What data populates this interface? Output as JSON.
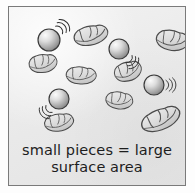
{
  "figure": {
    "background_color": "#ececec",
    "frame_color": "#7a7a7a",
    "page_color": "#ffffff"
  },
  "caption": {
    "line1": "small pieces = large",
    "line2": "surface area",
    "text_color": "#1d1d1d"
  },
  "legend": {
    "sphere_label": "reactant particle",
    "chunk_label": "solid piece",
    "motion_label": "motion lines"
  },
  "diagram_data": {
    "type": "diagram",
    "sphere_color_light": "#f2f2f2",
    "sphere_color_dark": "#8e8e8e",
    "sphere_outline": "#3a3a3a",
    "chunk_fill": "#dcdcdc",
    "chunk_outline": "#4a4a4a",
    "motion_line_color": "#2e2e2e",
    "sphere_count": 4,
    "chunk_count": 9,
    "spheres": [
      {
        "id": "sphere-1",
        "cx": 40,
        "cy": 33,
        "r": 11,
        "motion": "upper-right"
      },
      {
        "id": "sphere-2",
        "cx": 110,
        "cy": 42,
        "r": 10,
        "motion": "lower-right"
      },
      {
        "id": "sphere-3",
        "cx": 50,
        "cy": 92,
        "r": 10,
        "motion": "lower-left"
      },
      {
        "id": "sphere-4",
        "cx": 145,
        "cy": 78,
        "r": 10,
        "motion": "right"
      }
    ],
    "chunks": [
      {
        "id": "chunk-1",
        "cx": 82,
        "cy": 29,
        "w": 32,
        "h": 19,
        "rot": -12
      },
      {
        "id": "chunk-2",
        "cx": 163,
        "cy": 34,
        "w": 30,
        "h": 20,
        "rot": 10
      },
      {
        "id": "chunk-3",
        "cx": 34,
        "cy": 57,
        "w": 25,
        "h": 18,
        "rot": -6
      },
      {
        "id": "chunk-4",
        "cx": 72,
        "cy": 69,
        "w": 27,
        "h": 17,
        "rot": 4
      },
      {
        "id": "chunk-5",
        "cx": 119,
        "cy": 65,
        "w": 25,
        "h": 19,
        "rot": -15
      },
      {
        "id": "chunk-6",
        "cx": 110,
        "cy": 94,
        "w": 24,
        "h": 17,
        "rot": 8
      },
      {
        "id": "chunk-7",
        "cx": 50,
        "cy": 116,
        "w": 26,
        "h": 17,
        "rot": -8
      },
      {
        "id": "chunk-8",
        "cx": 152,
        "cy": 113,
        "w": 38,
        "h": 21,
        "rot": -22
      },
      {
        "id": "chunk-9",
        "cx": 128,
        "cy": 52,
        "w": 10,
        "h": 8,
        "rot": 0
      }
    ]
  }
}
